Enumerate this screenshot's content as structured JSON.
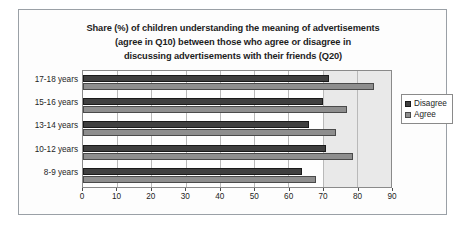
{
  "chart_data": {
    "type": "bar",
    "orientation": "horizontal",
    "title": "Share (%) of children understanding the meaning of advertisements (agree in Q10) between those who agree or disagree in discussing advertisements with their friends (Q20)",
    "title_lines": [
      "Share (%) of children understanding the meaning of advertisements",
      "(agree in Q10) between those who agree or disagree in",
      "discussing advertisements with their friends (Q20)"
    ],
    "categories": [
      "17-18 years",
      "15-16 years",
      "13-14 years",
      "10-12 years",
      "8-9 years"
    ],
    "series": [
      {
        "name": "Disagree",
        "color": "#3f3f3f",
        "values": [
          72,
          70,
          66,
          71,
          64
        ]
      },
      {
        "name": "Agree",
        "color": "#8e8e8e",
        "values": [
          85,
          77,
          74,
          79,
          68
        ]
      }
    ],
    "legend": [
      "Disagree",
      "Agree"
    ],
    "legend_position": "right",
    "xlabel": "",
    "ylabel": "",
    "xlim": [
      0,
      90
    ],
    "xticks": [
      0,
      10,
      20,
      30,
      40,
      50,
      60,
      70,
      80,
      90
    ],
    "xtick_labels": [
      "0",
      "10",
      "20",
      "30",
      "40",
      "50",
      "60",
      "70",
      "80",
      "90"
    ],
    "grid": true,
    "grid_axis": "x"
  }
}
